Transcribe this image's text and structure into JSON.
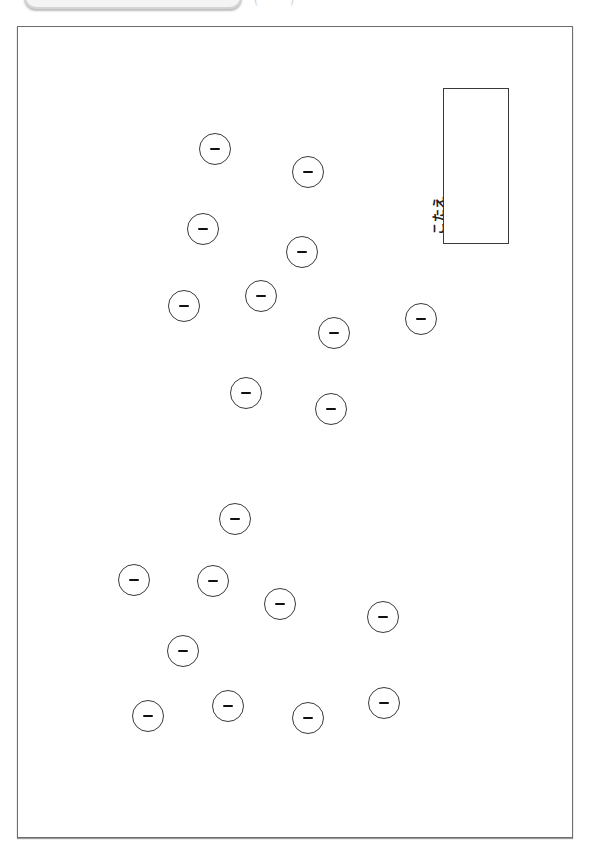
{
  "header": {
    "paren_text": "(   )"
  },
  "answer": {
    "label": "こたえ",
    "value": ""
  },
  "ions": {
    "symbol": "minus-icon",
    "count": 22,
    "positions": [
      {
        "x": 215,
        "y": 149
      },
      {
        "x": 308,
        "y": 172
      },
      {
        "x": 203,
        "y": 229
      },
      {
        "x": 302,
        "y": 252
      },
      {
        "x": 261,
        "y": 296
      },
      {
        "x": 184,
        "y": 306
      },
      {
        "x": 334,
        "y": 333
      },
      {
        "x": 421,
        "y": 319
      },
      {
        "x": 246,
        "y": 393
      },
      {
        "x": 331,
        "y": 409
      },
      {
        "x": 235,
        "y": 519
      },
      {
        "x": 134,
        "y": 580
      },
      {
        "x": 213,
        "y": 581
      },
      {
        "x": 280,
        "y": 604
      },
      {
        "x": 383,
        "y": 617
      },
      {
        "x": 183,
        "y": 651
      },
      {
        "x": 148,
        "y": 716
      },
      {
        "x": 228,
        "y": 706
      },
      {
        "x": 308,
        "y": 718
      },
      {
        "x": 384,
        "y": 703
      }
    ]
  }
}
